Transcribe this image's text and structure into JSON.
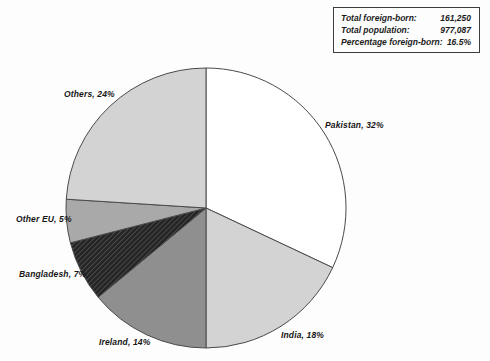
{
  "stats_box": {
    "rows": [
      {
        "label": "Total foreign-born:",
        "value": "161,250"
      },
      {
        "label": "Total population:",
        "value": "977,087"
      },
      {
        "label": "Percentage foreign-born:",
        "value": "16.5%"
      }
    ]
  },
  "chart_data": {
    "type": "pie",
    "title": "",
    "unit": "%",
    "start_angle_deg": 0,
    "direction": "clockwise",
    "outline_color": "#4a4a4a",
    "total": 100,
    "slices": [
      {
        "name": "Pakistan",
        "value": 32,
        "label": "Pakistan, 32%",
        "color": "#ffffff"
      },
      {
        "name": "India",
        "value": 18,
        "label": "India, 18%",
        "color": "#d3d3d3"
      },
      {
        "name": "Ireland",
        "value": 14,
        "label": "Ireland, 14%",
        "color": "#8f8f8f"
      },
      {
        "name": "Bangladesh",
        "value": 7,
        "label": "Bangladesh, 7%",
        "color": "#242424",
        "pattern": "diagonal-hatch",
        "pattern_line_color": "#4d4d4d"
      },
      {
        "name": "Other EU",
        "value": 5,
        "label": "Other EU, 5%",
        "color": "#a9a9a9"
      },
      {
        "name": "Others",
        "value": 24,
        "label": "Others, 24%",
        "color": "#d3d3d3"
      }
    ]
  }
}
